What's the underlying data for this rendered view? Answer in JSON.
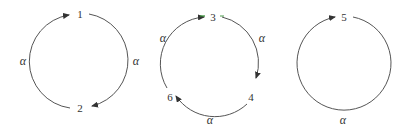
{
  "diagram": {
    "type": "permutation-cycles",
    "colors": {
      "stroke": "#555555",
      "text": "#333333",
      "accent": "#2e8b2e"
    },
    "cycles": [
      {
        "id": "cycle-1-2",
        "nodes": [
          {
            "label": "1",
            "x": 80,
            "y": 18
          },
          {
            "label": "2",
            "x": 80,
            "y": 112
          }
        ],
        "edges": [
          {
            "from": "1",
            "to": "2",
            "label": "α",
            "label_x": 135,
            "label_y": 65
          },
          {
            "from": "2",
            "to": "1",
            "label": "α",
            "label_x": 23,
            "label_y": 65
          }
        ]
      },
      {
        "id": "cycle-3-4-6",
        "nodes": [
          {
            "label": "3",
            "x": 213,
            "y": 21
          },
          {
            "label": "4",
            "x": 250,
            "y": 101
          },
          {
            "label": "6",
            "x": 171,
            "y": 101
          }
        ],
        "edges": [
          {
            "from": "3",
            "to": "4",
            "label": "α",
            "label_x": 261,
            "label_y": 42
          },
          {
            "from": "4",
            "to": "6",
            "label": "α",
            "label_x": 210,
            "label_y": 123
          },
          {
            "from": "6",
            "to": "3",
            "label": "α",
            "label_x": 163,
            "label_y": 42
          }
        ]
      },
      {
        "id": "cycle-5",
        "nodes": [
          {
            "label": "5",
            "x": 345,
            "y": 21
          }
        ],
        "edges": [
          {
            "from": "5",
            "to": "5",
            "label": "α",
            "label_x": 343,
            "label_y": 123
          }
        ]
      }
    ]
  }
}
